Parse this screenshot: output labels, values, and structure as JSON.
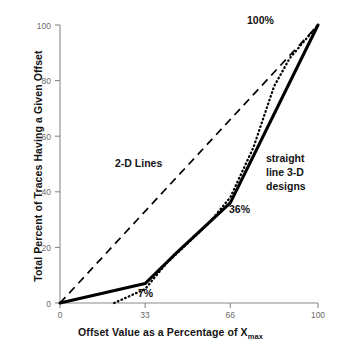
{
  "chart_data": {
    "type": "line",
    "title": "",
    "subtitle": "",
    "xlabel": "Offset Value as a Percentage of X",
    "xlabel_sub": "max",
    "ylabel": "Total Percent of Traces Having a Given Offset",
    "xlim": [
      0,
      100
    ],
    "ylim": [
      0,
      100
    ],
    "xticks": [
      0,
      33,
      66,
      100
    ],
    "xtick_labels": [
      "0",
      "33",
      "66",
      "100"
    ],
    "yticks": [
      0,
      20,
      40,
      60,
      80,
      100
    ],
    "ytick_labels": [
      "0",
      "20",
      "40",
      "60",
      "80",
      "100"
    ],
    "grid": false,
    "legend": "inline-annotations",
    "legend_position": "inline",
    "series": [
      {
        "name": "straight line 3-D designs",
        "style": "solid",
        "color": "#000000",
        "x": [
          0,
          33,
          44,
          66,
          100
        ],
        "y": [
          0,
          7,
          17,
          36,
          100
        ]
      },
      {
        "name": "dotted distribution",
        "style": "dotted",
        "color": "#000000",
        "x": [
          21,
          33,
          41,
          50,
          58,
          66,
          75,
          83,
          89,
          100
        ],
        "y": [
          0,
          5,
          14,
          22,
          29,
          38,
          56,
          78,
          88,
          100
        ]
      },
      {
        "name": "2-D Lines",
        "style": "dashed",
        "color": "#000000",
        "x": [
          0,
          100
        ],
        "y": [
          0,
          100
        ]
      }
    ],
    "annotations": [
      {
        "id": "2d_lines",
        "text": "2-D Lines",
        "x": 21,
        "y": 51
      },
      {
        "id": "hundred_pct",
        "text": "100%",
        "x": 73,
        "y": 97
      },
      {
        "id": "thirtysix_pct",
        "text": "36%",
        "x": 66,
        "y": 35
      },
      {
        "id": "seven_pct",
        "text": "7%",
        "x": 31,
        "y": 5
      },
      {
        "id": "straight_line_3d",
        "text": "straight line 3-D designs",
        "x": 81,
        "y": 60
      }
    ]
  },
  "axes": {
    "y_title": "Total Percent of Traces Having a Given Offset",
    "x_title": "Offset Value as a Percentage of X",
    "x_title_sub": "max"
  },
  "labels": {
    "two_d_lines": "2-D Lines",
    "hundred_percent": "100%",
    "thirtysix_percent": "36%",
    "seven_percent": "7%",
    "straight_line_1": "straight",
    "straight_line_2": "line 3-D",
    "straight_line_3": "designs"
  },
  "colors": {
    "axis": "#8a8a8a",
    "tick_text": "#6b6b6b",
    "series": "#000000",
    "label_text": "#141414",
    "background": "#ffffff"
  }
}
